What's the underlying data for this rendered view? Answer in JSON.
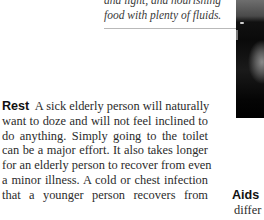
{
  "caption": {
    "lines": [
      "and light, and nourishing",
      "food with plenty of fluids."
    ]
  },
  "photo": {
    "description": "black-and-white photograph (cropped)"
  },
  "body": {
    "heading": "Rest",
    "lines": [
      "A sick elderly person will naturally",
      "want to doze and will not feel inclined to",
      "do anything. Simply going to the toilet",
      "can be a major effort. It also takes longer",
      "for an elderly person to recover from even",
      "a minor illness. A cold or chest infection",
      "that a younger person recovers from"
    ]
  },
  "side_column": {
    "heading": "Aids",
    "text": "differ"
  }
}
